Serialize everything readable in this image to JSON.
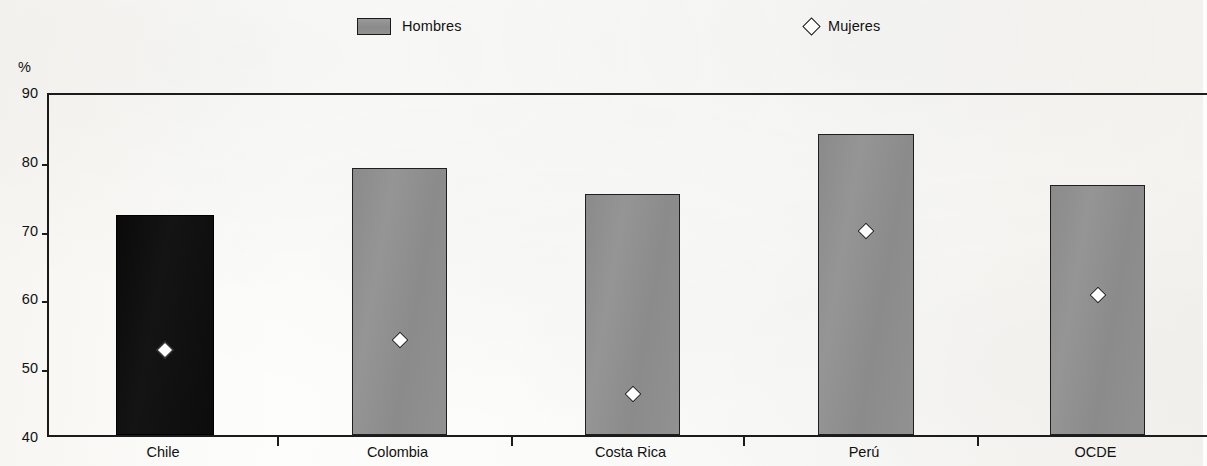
{
  "legend": {
    "items": [
      {
        "label": "Hombres",
        "marker": "filled-rect",
        "color": "#8e8e8e"
      },
      {
        "label": "Mujeres",
        "marker": "open-diamond",
        "color": "#ffffff"
      }
    ]
  },
  "axis": {
    "y_unit": "%",
    "y_ticks": [
      "90",
      "80",
      "70",
      "60",
      "50",
      "40"
    ],
    "x_labels": [
      "Chile",
      "Colombia",
      "Costa Rica",
      "Perú",
      "OCDE"
    ]
  },
  "colors": {
    "bar_default": "#8e8e8e",
    "bar_highlight": "#0d0d0d",
    "marker_fill": "#ffffff",
    "axis": "#1b1b1b",
    "background": "#fdfdfb"
  },
  "chart_data": {
    "type": "bar",
    "title": "",
    "subtitle": "",
    "xlabel": "",
    "ylabel": "%",
    "ylim": [
      40,
      90
    ],
    "ytick_step": 10,
    "grid": false,
    "legend_position": "top",
    "categories": [
      "Chile",
      "Colombia",
      "Costa Rica",
      "Perú",
      "OCDE"
    ],
    "highlight_category": "Chile",
    "series": [
      {
        "name": "Hombres",
        "type": "bar",
        "values": [
          72.0,
          78.8,
          75.1,
          83.8,
          76.3
        ]
      },
      {
        "name": "Mujeres",
        "type": "scatter",
        "marker": "diamond",
        "values": [
          53.2,
          54.7,
          46.8,
          70.5,
          61.2
        ]
      }
    ]
  }
}
